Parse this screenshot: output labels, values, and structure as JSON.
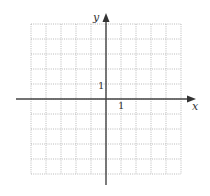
{
  "diagram": {
    "type": "coordinate-grid",
    "x_axis_label": "x",
    "y_axis_label": "y",
    "x_tick_label": "1",
    "y_tick_label": "1",
    "x_range": [
      -5,
      5
    ],
    "y_range": [
      -5,
      5
    ],
    "grid_style": "dotted",
    "colors": {
      "grid": "#9a9a9a",
      "axis": "#444444",
      "text": "#333333"
    }
  }
}
